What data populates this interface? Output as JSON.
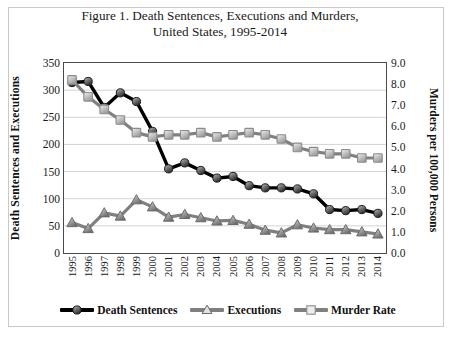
{
  "figure": {
    "title_line1": "Figure 1.  Death Sentences, Executions and Murders,",
    "title_line2": "United States, 1995-2014"
  },
  "axes": {
    "y_left_title": "Death Sentences and Executions",
    "y_right_title": "Murders per 100,000 Persons",
    "y_left_ticks": [
      "350",
      "300",
      "250",
      "200",
      "150",
      "100",
      "50",
      "0"
    ],
    "y_right_ticks": [
      "9.0",
      "8.0",
      "7.0",
      "6.0",
      "5.0",
      "4.0",
      "3.0",
      "2.0",
      "1.0",
      "0.0"
    ]
  },
  "legend": {
    "items": [
      {
        "label": "Death Sentences",
        "color": "#000000",
        "marker": "circle"
      },
      {
        "label": "Executions",
        "color": "#7f7f7f",
        "marker": "triangle"
      },
      {
        "label": "Murder Rate",
        "color": "#808080",
        "marker": "square"
      }
    ]
  },
  "chart_data": {
    "type": "line",
    "title": "Figure 1.  Death Sentences, Executions and Murders, United States, 1995-2014",
    "xlabel": "",
    "ylabel": "Death Sentences and Executions",
    "y2label": "Murders per 100,000 Persons",
    "ylim": [
      0,
      350
    ],
    "y2lim": [
      0,
      9
    ],
    "grid": true,
    "legend_position": "bottom",
    "categories": [
      "1995",
      "1996",
      "1997",
      "1998",
      "1999",
      "2000",
      "2001",
      "2002",
      "2003",
      "2004",
      "2005",
      "2006",
      "2007",
      "2008",
      "2009",
      "2010",
      "2011",
      "2012",
      "2013",
      "2014"
    ],
    "series": [
      {
        "name": "Death Sentences",
        "axis": "left",
        "color": "#000000",
        "marker": "circle",
        "values": [
          314,
          316,
          268,
          295,
          279,
          224,
          155,
          166,
          152,
          138,
          141,
          124,
          120,
          120,
          118,
          109,
          80,
          78,
          80,
          73
        ]
      },
      {
        "name": "Executions",
        "axis": "left",
        "color": "#7f7f7f",
        "marker": "triangle",
        "values": [
          56,
          45,
          74,
          68,
          98,
          85,
          66,
          71,
          65,
          59,
          60,
          53,
          42,
          37,
          52,
          46,
          43,
          43,
          39,
          35
        ]
      },
      {
        "name": "Murder Rate",
        "axis": "right",
        "color": "#808080",
        "marker": "square",
        "values": [
          8.2,
          7.4,
          6.8,
          6.3,
          5.7,
          5.5,
          5.6,
          5.6,
          5.7,
          5.5,
          5.6,
          5.7,
          5.6,
          5.4,
          5.0,
          4.8,
          4.7,
          4.7,
          4.5,
          4.5
        ]
      }
    ]
  }
}
